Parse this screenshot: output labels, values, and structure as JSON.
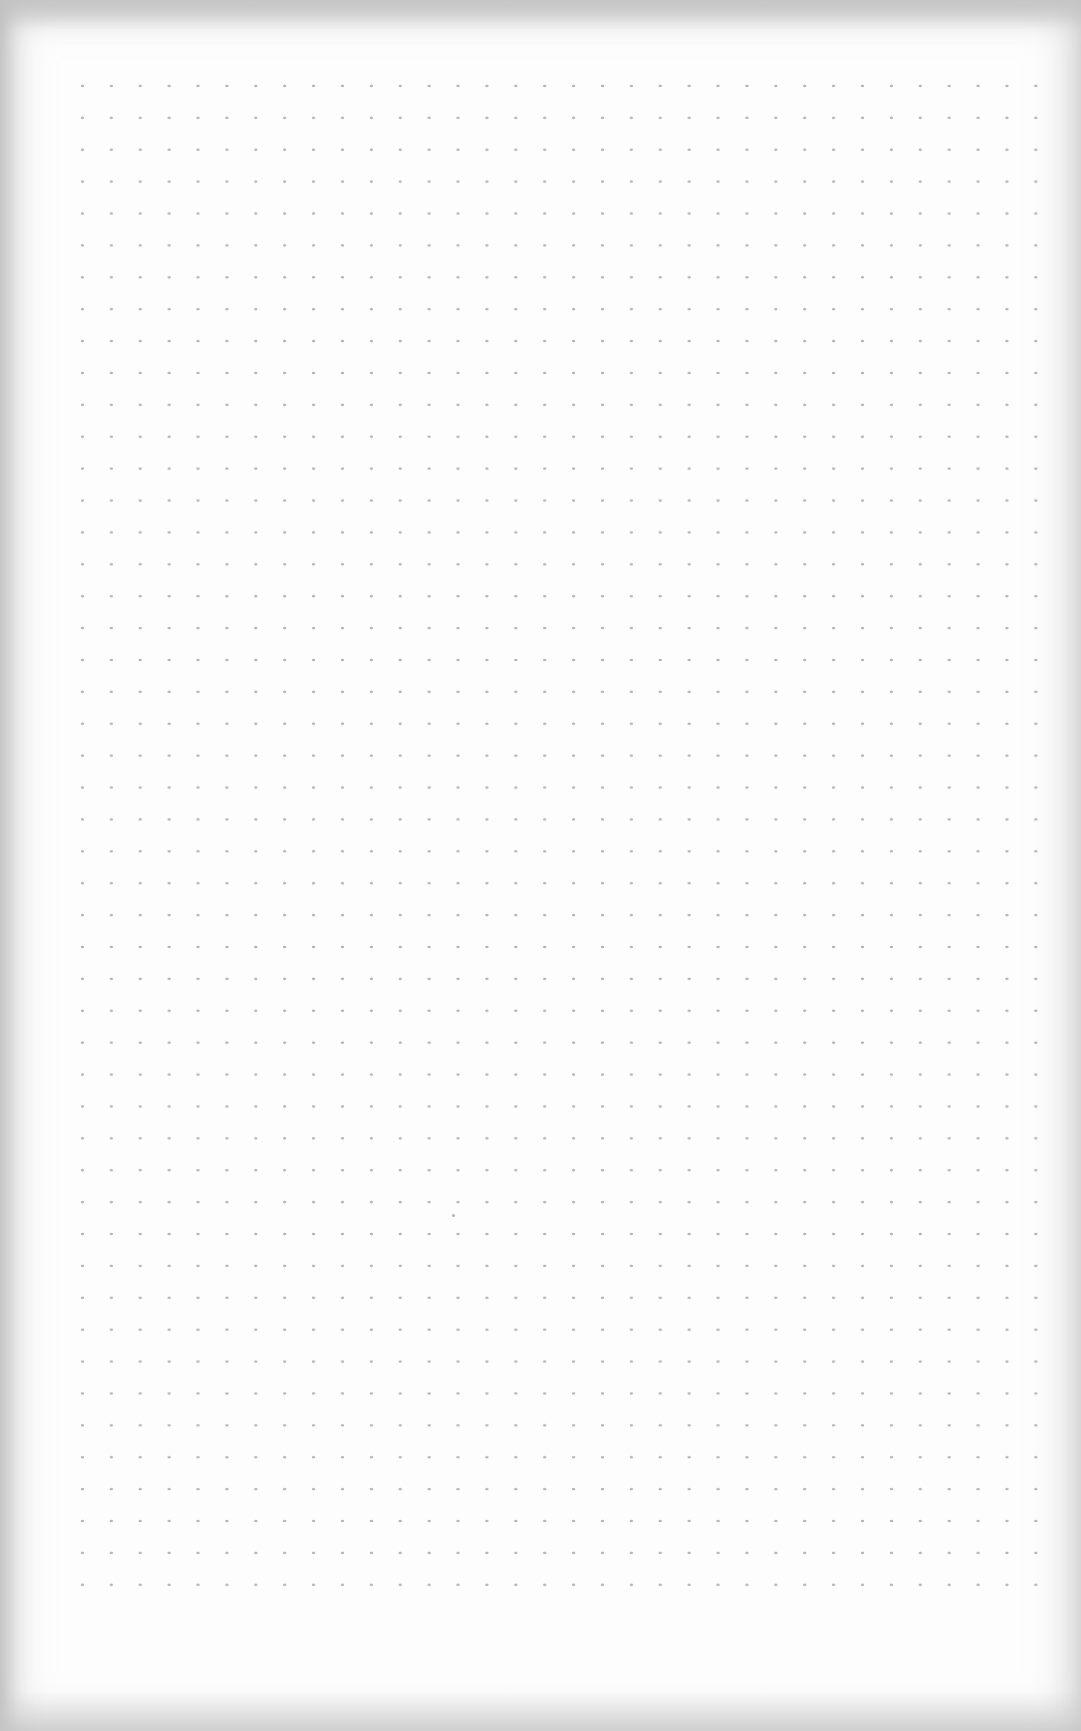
{
  "sheet": {
    "type": "dot-grid paper",
    "paper_color": "#fdfdfd",
    "dot_color": "#b4b4b4",
    "grid": {
      "columns": 35,
      "rows": 49,
      "spacing_x_px": 29,
      "spacing_y_px": 32
    }
  }
}
